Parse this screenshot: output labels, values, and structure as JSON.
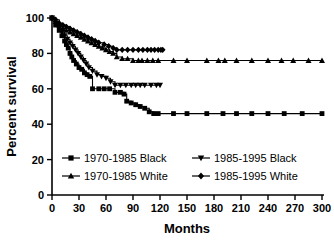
{
  "chart_data": {
    "type": "line",
    "title": "",
    "subtitle": "",
    "xlabel": "Months",
    "ylabel": "Percent survival",
    "xlim": [
      0,
      300
    ],
    "ylim": [
      0,
      100
    ],
    "xticks": [
      0,
      30,
      60,
      90,
      120,
      150,
      180,
      210,
      240,
      270,
      300
    ],
    "yticks": [
      0,
      20,
      40,
      60,
      80,
      100
    ],
    "grid": false,
    "legend_position": "inside-bottom-left",
    "step_style": "post",
    "series": [
      {
        "name": "1970-1985 Black",
        "marker": "square",
        "x": [
          0,
          4,
          8,
          11,
          14,
          16,
          18,
          20,
          22,
          24,
          27,
          30,
          33,
          36,
          39,
          42,
          45,
          52,
          58,
          64,
          70,
          76,
          80,
          83,
          88,
          93,
          98,
          103,
          108,
          113,
          118,
          135,
          150,
          172,
          190,
          205,
          222,
          240,
          258,
          278,
          300
        ],
        "y": [
          100,
          96,
          93,
          90,
          87,
          85,
          83,
          80,
          78,
          76,
          74,
          72,
          71,
          69,
          68,
          67,
          60,
          60,
          60,
          60,
          58,
          58,
          57,
          53,
          52,
          51,
          50,
          49,
          47,
          46,
          46,
          46,
          46,
          46,
          46,
          46,
          46,
          46,
          46,
          46,
          46
        ]
      },
      {
        "name": "1985-1995 Black",
        "marker": "triangle-down",
        "x": [
          0,
          4,
          8,
          11,
          14,
          17,
          20,
          23,
          26,
          29,
          32,
          35,
          38,
          41,
          45,
          50,
          55,
          60,
          65,
          70,
          76,
          82,
          88,
          93,
          98,
          103,
          110,
          116,
          120
        ],
        "y": [
          100,
          97,
          94,
          92,
          90,
          88,
          86,
          84,
          82,
          80,
          78,
          76,
          74,
          72,
          70,
          68,
          67,
          66,
          64,
          62,
          62,
          62,
          62,
          62,
          62,
          62,
          62,
          62,
          62
        ]
      },
      {
        "name": "1970-1985 White",
        "marker": "triangle-up",
        "x": [
          0,
          4,
          8,
          12,
          16,
          20,
          24,
          28,
          32,
          36,
          40,
          44,
          48,
          52,
          56,
          60,
          64,
          68,
          72,
          78,
          84,
          90,
          96,
          100,
          106,
          112,
          118,
          135,
          150,
          172,
          185,
          192,
          205,
          222,
          240,
          255,
          268,
          285,
          300
        ],
        "y": [
          100,
          98,
          96,
          94,
          93,
          92,
          91,
          90,
          89,
          88,
          87,
          86,
          85,
          84,
          83,
          82,
          81,
          80,
          78,
          77,
          77,
          76,
          76,
          76,
          76,
          76,
          76,
          76,
          76,
          76,
          76,
          76,
          76,
          76,
          76,
          76,
          76,
          76,
          76
        ]
      },
      {
        "name": "1985-1995 White",
        "marker": "diamond",
        "x": [
          0,
          4,
          8,
          12,
          16,
          20,
          24,
          28,
          32,
          36,
          40,
          44,
          48,
          52,
          58,
          63,
          68,
          72,
          78,
          84,
          90,
          96,
          101,
          106,
          110,
          114,
          118,
          121,
          123
        ],
        "y": [
          100,
          99,
          97,
          96,
          95,
          94,
          93,
          92,
          91,
          90,
          89,
          88,
          87,
          86,
          85,
          84,
          83,
          82,
          82,
          82,
          82,
          82,
          82,
          82,
          82,
          82,
          82,
          82,
          82
        ]
      }
    ],
    "legend": [
      {
        "label": "1970-1985 Black",
        "marker": "square"
      },
      {
        "label": "1985-1995 Black",
        "marker": "triangle-down"
      },
      {
        "label": "1970-1985 White",
        "marker": "triangle-up"
      },
      {
        "label": "1985-1995 White",
        "marker": "diamond"
      }
    ],
    "colors": {
      "ink": "#000000",
      "background": "#ffffff"
    }
  }
}
